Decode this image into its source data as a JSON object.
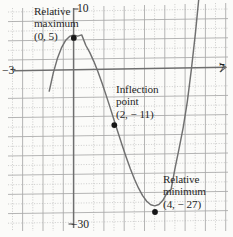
{
  "figure": {
    "background_color": "#fbfbf9",
    "curve_color": "#6f6f6f",
    "grid_color": "#b9b9b9",
    "axis_color": "#7c7c7c",
    "point_color": "#1a1a1a"
  },
  "axis_labels": {
    "top": "10",
    "bottom": "−30",
    "left": "−3",
    "right": "7"
  },
  "annotations": {
    "relative_maximum": {
      "line1": "Relative",
      "line2": "maximum",
      "line3": "(0, 5)"
    },
    "inflection": {
      "line1": "Inflection",
      "line2": "point",
      "line3": "(2, − 11)"
    },
    "relative_minimum": {
      "line1": "Relative",
      "line2": "minimum",
      "line3": "(4, − 27)"
    }
  },
  "chart_data": {
    "type": "line",
    "title": "",
    "xlabel": "",
    "ylabel": "",
    "xlim": [
      -3,
      7
    ],
    "ylim": [
      -30,
      10
    ],
    "grid": true,
    "legend": null,
    "x_tick_labels": [
      "−3",
      "7"
    ],
    "y_tick_labels": [
      "10",
      "−30"
    ],
    "x_gridline_step": 1,
    "y_gridline_step": 5,
    "series": [
      {
        "name": "f(x) = x³ − 6x² + 5",
        "x": [
          -1.2,
          -1.0,
          -0.8,
          -0.6,
          -0.4,
          -0.2,
          0.0,
          0.2,
          0.4,
          0.6,
          0.8,
          1.0,
          1.2,
          1.4,
          1.6,
          1.8,
          2.0,
          2.2,
          2.4,
          2.6,
          2.8,
          3.0,
          3.2,
          3.4,
          3.6,
          3.8,
          4.0,
          4.2,
          4.4,
          4.6,
          4.8,
          5.0,
          5.2,
          5.4,
          5.6,
          5.8,
          6.0,
          6.2,
          6.4
        ],
        "y": [
          -5.37,
          -2.0,
          0.65,
          2.62,
          3.98,
          4.75,
          5.0,
          4.77,
          5.0,
          3.06,
          1.67,
          0.0,
          -1.91,
          -4.02,
          -6.27,
          -8.61,
          -11.0,
          -13.39,
          -15.73,
          -17.98,
          -20.09,
          -22.0,
          -23.67,
          -25.06,
          -26.11,
          -26.78,
          -27.0,
          -26.76,
          -25.98,
          -24.62,
          -24.0,
          -20.0,
          -16.33,
          -12.46,
          -7.72,
          -1.73,
          5.0,
          12.69,
          21.86
        ]
      }
    ],
    "points": [
      {
        "label": "Relative maximum",
        "x": 0,
        "y": 5,
        "kind": "relative-maximum"
      },
      {
        "label": "Inflection point",
        "x": 2,
        "y": -11,
        "kind": "inflection"
      },
      {
        "label": "Relative minimum",
        "x": 4,
        "y": -27,
        "kind": "relative-minimum"
      }
    ]
  }
}
